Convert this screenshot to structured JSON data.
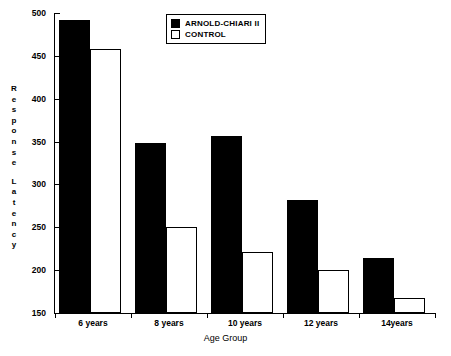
{
  "chart_data": {
    "type": "bar",
    "title": "",
    "xlabel": "Age Group",
    "ylabel": "Response Latency",
    "ylabel_letters": [
      "R",
      "e",
      "s",
      "p",
      "o",
      "n",
      "s",
      "e",
      "",
      "L",
      "a",
      "t",
      "e",
      "n",
      "c",
      "y"
    ],
    "categories": [
      "6 years",
      "8 years",
      "10 years",
      "12 years",
      "14years"
    ],
    "series": [
      {
        "name": "ARNOLD-CHIARI II",
        "color": "#000000",
        "style": "filled",
        "values": [
          492,
          348,
          356,
          282,
          214
        ]
      },
      {
        "name": "CONTROL",
        "color": "#FFFFFF",
        "style": "hollow",
        "values": [
          458,
          250,
          221,
          200,
          167
        ]
      }
    ],
    "ylim": [
      150,
      500
    ],
    "yticks": [
      150,
      200,
      250,
      300,
      350,
      400,
      450,
      500
    ],
    "ytick_labels": [
      "150",
      "200",
      "250",
      "300",
      "350",
      "400",
      "450",
      "500"
    ],
    "grid": false,
    "legend_position": "top-center"
  },
  "legend": {
    "entries": [
      {
        "label": "ARNOLD-CHIARI II",
        "swatch": "filled-square-icon"
      },
      {
        "label": "CONTROL",
        "swatch": "hollow-square-icon"
      }
    ]
  }
}
